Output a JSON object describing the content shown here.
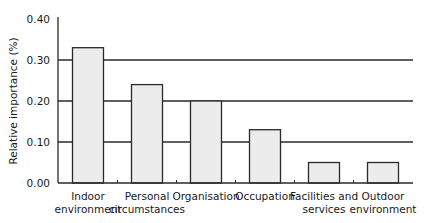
{
  "chart_data": {
    "type": "bar",
    "title": "",
    "xlabel": "",
    "ylabel": "Relative importance (%)",
    "ylim": [
      0,
      0.4
    ],
    "yticks": [
      "0.00",
      "0.10",
      "0.20",
      "0.30",
      "0.40"
    ],
    "grid": "horizontal at 0.10, 0.20, 0.30",
    "legend": "none",
    "categories": [
      [
        "Indoor",
        "environment"
      ],
      [
        "Personal",
        "circumstances"
      ],
      [
        "Organisation"
      ],
      [
        "Occupation"
      ],
      [
        "Facilities and",
        "services"
      ],
      [
        "Outdoor",
        "environment"
      ]
    ],
    "category_names": [
      "Indoor environment",
      "Personal circumstances",
      "Organisation",
      "Occupation",
      "Facilities and services",
      "Outdoor environment"
    ],
    "values": [
      0.33,
      0.24,
      0.2,
      0.13,
      0.05,
      0.05
    ],
    "colors": {
      "bar_fill": "#ececec",
      "bar_stroke": "#2a2a2a",
      "axis": "#2a2a2a",
      "grid": "#2a2a2a"
    }
  }
}
